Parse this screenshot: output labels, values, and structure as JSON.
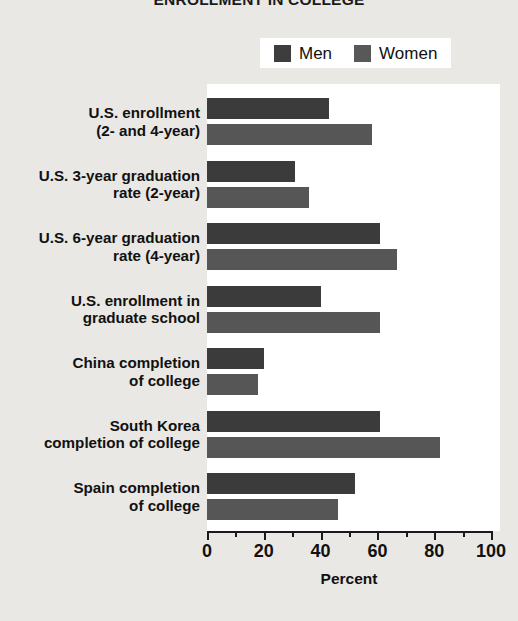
{
  "chart_data": {
    "type": "bar",
    "orientation": "horizontal",
    "title": "ENROLLMENT IN COLLEGE",
    "xlabel": "Percent",
    "ylabel": "",
    "xlim": [
      0,
      100
    ],
    "xticks": [
      0,
      20,
      40,
      60,
      80,
      100
    ],
    "xtick_labels": [
      "0",
      "20",
      "40",
      "60",
      "80",
      "100"
    ],
    "minor_tick_interval": 10,
    "grid": false,
    "legend_position": "top-right",
    "categories": [
      "U.S. enrollment\n(2- and 4-year)",
      "U.S. 3-year graduation\nrate (2-year)",
      "U.S. 6-year graduation\nrate (4-year)",
      "U.S. enrollment in\ngraduate school",
      "China completion\nof college",
      "South Korea\ncompletion of college",
      "Spain completion\nof college"
    ],
    "category_lines": [
      [
        "U.S. enrollment",
        "(2- and 4-year)"
      ],
      [
        "U.S. 3-year graduation",
        "rate (2-year)"
      ],
      [
        "U.S. 6-year graduation",
        "rate (4-year)"
      ],
      [
        "U.S. enrollment in",
        "graduate school"
      ],
      [
        "China completion",
        "of college"
      ],
      [
        "South Korea",
        "completion of college"
      ],
      [
        "Spain completion",
        "of college"
      ]
    ],
    "series": [
      {
        "name": "Men",
        "color": "#3b3b3b",
        "values": [
          43,
          31,
          61,
          40,
          20,
          61,
          52
        ]
      },
      {
        "name": "Women",
        "color": "#565656",
        "values": [
          58,
          36,
          67,
          61,
          18,
          82,
          46
        ]
      }
    ]
  },
  "legend": {
    "items": [
      {
        "label": "Men",
        "color": "#3b3b3b"
      },
      {
        "label": "Women",
        "color": "#565656"
      }
    ]
  },
  "colors": {
    "men": "#3b3b3b",
    "women": "#565656",
    "panel": "#ffffff",
    "background": "#e9e8e4",
    "axis": "#1a1a1a"
  }
}
